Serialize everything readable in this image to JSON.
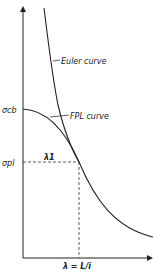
{
  "diagram": {
    "type": "buckling-curve-diagram",
    "curves": [
      {
        "id": "euler",
        "label": "Euler curve"
      },
      {
        "id": "fpl",
        "label": "FPL curve"
      }
    ],
    "y_axis_labels": {
      "sigma_cb": "σcb",
      "sigma_pl": "σpl"
    },
    "tangent_point_label": "λ1",
    "x_axis_label": "λ = L/i",
    "colors": {
      "line": "#222222",
      "background": "#ffffff"
    }
  }
}
